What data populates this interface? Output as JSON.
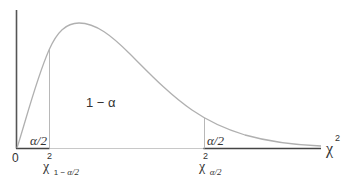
{
  "figure": {
    "type": "chi-square distribution with two-tailed critical regions",
    "colors": {
      "curve": "#b0b0b0",
      "axis": "#555555",
      "tail_baseline": "#444444",
      "center_baseline": "#c8c8c8",
      "critical_line": "#b8b8b8",
      "text": "#333333"
    }
  },
  "labels": {
    "center_area": "1 − α",
    "left_tail_area": "α/2",
    "right_tail_area": "α/2",
    "origin": "0",
    "x_axis_symbol": "χ",
    "x_axis_superscript": "2",
    "left_critical_symbol": "χ",
    "left_critical_superscript": "2",
    "left_critical_subscript_prefix": "1 − ",
    "left_critical_subscript_alpha": "α/2",
    "right_critical_symbol": "χ",
    "right_critical_superscript": "2",
    "right_critical_subscript": "α/2"
  }
}
